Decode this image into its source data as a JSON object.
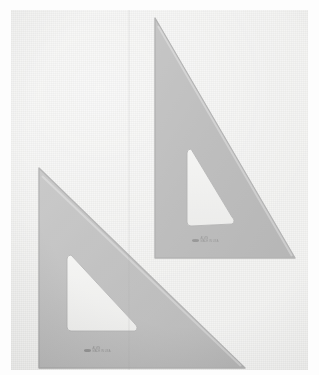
{
  "scene": {
    "title": "Two transparent drafting triangles (set squares) on paper",
    "width": 319,
    "height": 375,
    "background_color": "#ececea",
    "paper_margin_color": "#fdfdfd",
    "plastic_fill_color": "#9b9b9b",
    "cutout_color": "#e8e8e6",
    "edge_shadow_color": "#7d7d7d"
  },
  "objects": {
    "large_triangle": {
      "name": "large-drafting-triangle",
      "angle_label": "30-60-90",
      "fill_color": "#9d9d9d",
      "vertices": [
        [
          144,
          8
        ],
        [
          144,
          248
        ],
        [
          284,
          248
        ]
      ],
      "cutout_vertices": [
        [
          176,
          139
        ],
        [
          176,
          216
        ],
        [
          225,
          213
        ]
      ],
      "marking": {
        "logo": "brand-logo-oval",
        "line1": "ALVIN",
        "line2": "MADE IN USA"
      }
    },
    "small_triangle": {
      "name": "small-drafting-triangle",
      "angle_label": "45-45-90",
      "fill_color": "#a0a0a0",
      "vertices": [
        [
          28,
          158
        ],
        [
          28,
          358
        ],
        [
          234,
          358
        ]
      ],
      "cutout_vertices": [
        [
          56,
          245
        ],
        [
          56,
          321
        ],
        [
          127,
          321
        ]
      ],
      "marking": {
        "logo": "brand-logo-oval",
        "line1": "ALVIN",
        "line2": "MADE IN USA"
      }
    }
  },
  "artifacts": {
    "scan_seam": "vertical-scan-seam",
    "paper_grain": "paper-grain-texture",
    "vignette": "lighting-vignette"
  }
}
